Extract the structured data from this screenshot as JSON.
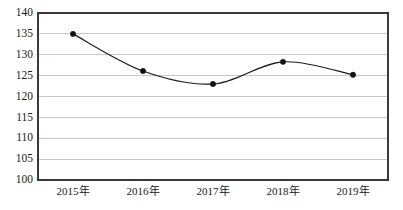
{
  "chart_data": {
    "type": "line",
    "title": "",
    "subtitle": "",
    "xlabel": "",
    "ylabel": "",
    "categories": [
      "2015年",
      "2016年",
      "2017年",
      "2018年",
      "2019年"
    ],
    "values": [
      135,
      126.1,
      123,
      128.3,
      125.2
    ],
    "series": [
      {
        "name": "",
        "values": [
          135,
          126.1,
          123,
          128.3,
          125.2
        ]
      }
    ],
    "ylim": [
      100,
      140
    ],
    "ytick_step": 5,
    "yticks": [
      100,
      105,
      110,
      115,
      120,
      125,
      130,
      135,
      140
    ],
    "ytick_labels": [
      "100",
      "105",
      "110",
      "115",
      "120",
      "125",
      "130",
      "135",
      "140"
    ],
    "xticks": [
      "2015年",
      "2016年",
      "2017年",
      "2018年",
      "2019年"
    ],
    "grid": true,
    "grid_axis": "y",
    "legend": false,
    "legend_position": "none",
    "markers": true,
    "marker_shape": "circle",
    "line_smoothing": "spline",
    "annotations": []
  },
  "style": {
    "background_color": "#ffffff",
    "grid_color": "#b9b9b9",
    "border_color": "#3a3a3a",
    "line_color": "#1c1c1c",
    "marker_color": "#111111",
    "tick_label_color": "#1a1a1a"
  },
  "plot_area": {
    "left": 38,
    "right": 388,
    "top": 13,
    "bottom": 180
  }
}
